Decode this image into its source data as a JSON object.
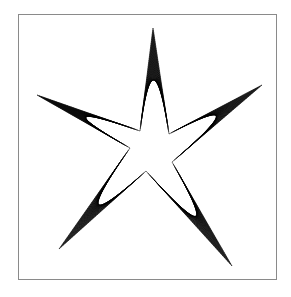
{
  "figure": {
    "type": "string-art-star",
    "frame": {
      "x": 18.5,
      "y": 14.5,
      "width": 258,
      "height": 265,
      "stroke": "#8a8a8a"
    },
    "line_color": "#000000",
    "background": "#ffffff",
    "center": [
      150,
      150
    ],
    "lines_per_arm": 48,
    "tips": [
      [
        153,
        28
      ],
      [
        262,
        85
      ],
      [
        232,
        266
      ],
      [
        59,
        249
      ],
      [
        37,
        95
      ]
    ],
    "inner_points": [
      [
        140,
        131
      ],
      [
        169,
        134
      ],
      [
        172,
        162
      ],
      [
        146,
        171
      ],
      [
        130,
        148
      ]
    ]
  }
}
